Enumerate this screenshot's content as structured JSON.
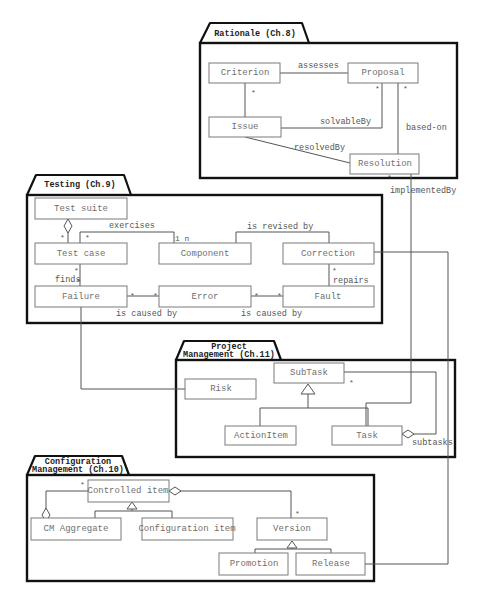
{
  "diagram": {
    "type": "UML class diagram",
    "packages": {
      "rationale": {
        "title": "Rationale (Ch.8)"
      },
      "testing": {
        "title": "Testing (Ch.9)"
      },
      "project_management": {
        "title_line1": "Project",
        "title_line2": "Management (Ch.11)"
      },
      "configuration_management": {
        "title_line1": "Configuration",
        "title_line2": "Management (Ch.10)"
      }
    },
    "classes": {
      "criterion": "Criterion",
      "proposal": "Proposal",
      "issue": "Issue",
      "resolution": "Resolution",
      "test_suite": "Test suite",
      "test_case": "Test case",
      "component": "Component",
      "correction": "Correction",
      "failure": "Failure",
      "error": "Error",
      "fault": "Fault",
      "subtask": "SubTask",
      "risk": "Risk",
      "action_item": "ActionItem",
      "task": "Task",
      "controlled_item": "Controlled item",
      "cm_aggregate": "CM Aggregate",
      "configuration_item": "Configuration item",
      "version": "Version",
      "promotion": "Promotion",
      "release": "Release"
    },
    "associations": {
      "assesses": "assesses",
      "solvable_by": "solvableBy",
      "resolved_by": "resolvedBy",
      "based_on": "based-on",
      "implemented_by": "implementedBy",
      "exercises": "exercises",
      "is_revised_by": "is revised by",
      "finds": "finds",
      "repairs": "repairs",
      "is_caused_by_1": "is caused by",
      "is_caused_by_2": "is caused by",
      "subtasks": "subtasks"
    },
    "multiplicities": {
      "many": "*",
      "one_n": "1 n"
    }
  }
}
